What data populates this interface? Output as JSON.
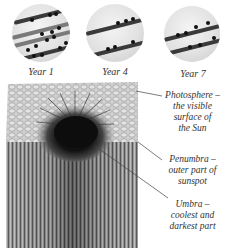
{
  "diagram": {
    "suns": [
      {
        "label": "Year 1",
        "bands": 4
      },
      {
        "label": "Year 4",
        "bands": 2
      },
      {
        "label": "Year 7",
        "bands": 2
      }
    ],
    "callouts": {
      "photosphere": {
        "name": "Photosphere –",
        "line2": "the visible",
        "line3": "surface of",
        "line4": "the Sun"
      },
      "penumbra": {
        "name": "Penumbra –",
        "line2": "outer part of",
        "line3": "sunspot"
      },
      "umbra": {
        "name": "Umbra –",
        "line2": "coolest and",
        "line3": "darkest part"
      }
    },
    "colors": {
      "sun_disc": "#e2e2e2",
      "band": "#3a3a3a",
      "umbra": "#111111",
      "photosphere": "#c8c8c8",
      "interior": "#8a8a8a"
    }
  }
}
